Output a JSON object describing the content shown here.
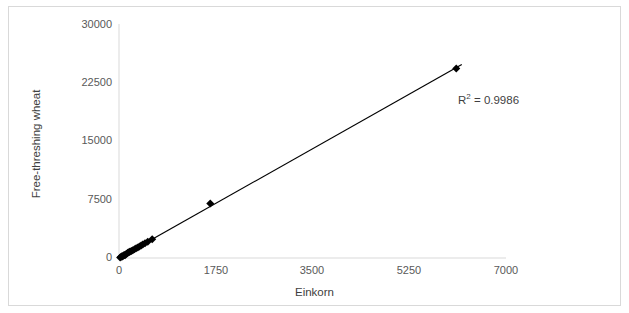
{
  "chart_data": {
    "type": "scatter",
    "title": "",
    "xlabel": "Einkorn",
    "ylabel": "Free-threshing wheat",
    "xlim": [
      0,
      7000
    ],
    "ylim": [
      0,
      30000
    ],
    "xticks": [
      "0",
      "1750",
      "3500",
      "5250",
      "7000"
    ],
    "yticks": [
      "0",
      "7500",
      "15000",
      "22500",
      "30000"
    ],
    "xtick_values": [
      0,
      1750,
      3500,
      5250,
      7000
    ],
    "ytick_values": [
      0,
      7500,
      15000,
      22500,
      30000
    ],
    "grid": false,
    "legend": false,
    "marker": "diamond",
    "marker_color": "#000000",
    "series": [
      {
        "name": "Einkorn vs Free-threshing wheat",
        "points": [
          [
            20,
            60
          ],
          [
            35,
            140
          ],
          [
            50,
            210
          ],
          [
            65,
            180
          ],
          [
            80,
            320
          ],
          [
            95,
            400
          ],
          [
            110,
            350
          ],
          [
            130,
            520
          ],
          [
            150,
            600
          ],
          [
            165,
            700
          ],
          [
            185,
            760
          ],
          [
            200,
            820
          ],
          [
            225,
            900
          ],
          [
            250,
            980
          ],
          [
            280,
            1120
          ],
          [
            310,
            1260
          ],
          [
            340,
            1350
          ],
          [
            370,
            1480
          ],
          [
            400,
            1600
          ],
          [
            430,
            1720
          ],
          [
            470,
            1900
          ],
          [
            520,
            2080
          ],
          [
            600,
            2400
          ],
          [
            1650,
            7000
          ],
          [
            6100,
            24300
          ]
        ]
      }
    ],
    "trendline": {
      "type": "linear",
      "slope": 4.0,
      "intercept": 0,
      "x_start": 0,
      "x_end": 6200,
      "color": "#000000",
      "r_squared_label": "R",
      "r_squared_sup": "2",
      "r_squared_value": "= 0.9986"
    },
    "annotations": [
      {
        "text": "R² = 0.9986",
        "x": 6000,
        "y": 20000
      }
    ],
    "axis_color": "#d9d9d9",
    "border_color": "#d9d9d9",
    "background": "#ffffff"
  }
}
